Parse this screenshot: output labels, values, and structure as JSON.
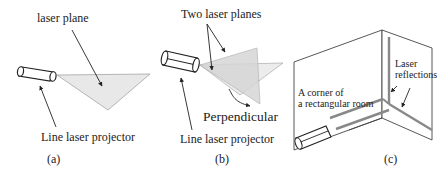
{
  "panels": {
    "a": {
      "caption": "(a)",
      "labels": {
        "plane": "laser plane",
        "projector": "Line laser projector"
      }
    },
    "b": {
      "caption": "(b)",
      "labels": {
        "planes": "Two laser planes",
        "perpendicular": "Perpendicular",
        "projector": "Line laser projector"
      }
    },
    "c": {
      "caption": "(c)",
      "labels": {
        "corner_line1": "A corner of",
        "corner_line2": "a rectangular room",
        "reflections_line1": "Laser",
        "reflections_line2": "reflections"
      }
    }
  },
  "colors": {
    "stroke": "#333333",
    "plane_fill": "#e6e6e6",
    "plane_fill_dark": "#cfcfcf",
    "laser_line": "#888888"
  }
}
